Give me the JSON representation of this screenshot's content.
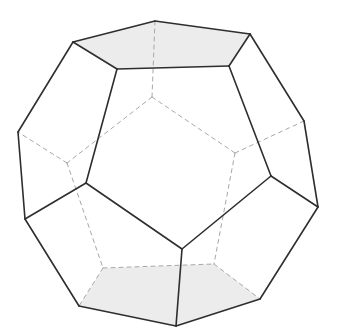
{
  "diagram": {
    "title": "Dodecahedron",
    "colors": {
      "background": "#ffffff",
      "visible_edge": "#2e2e2e",
      "hidden_edge": "#a8a8a8",
      "face_fill": "#ececec"
    },
    "vertices": {
      "T1": [
        73,
        42
      ],
      "T2": [
        155,
        21
      ],
      "T3": [
        250,
        34
      ],
      "T4": [
        229,
        66
      ],
      "T5": [
        117,
        69
      ],
      "L1": [
        18,
        132
      ],
      "R1": [
        304,
        121
      ],
      "FL": [
        86,
        183
      ],
      "FR": [
        271,
        176
      ],
      "L2": [
        25,
        219
      ],
      "R2": [
        318,
        207
      ],
      "FB": [
        182,
        249
      ],
      "B1": [
        79,
        306
      ],
      "B2": [
        176,
        326
      ],
      "B3": [
        260,
        299
      ],
      "H1": [
        152,
        97
      ],
      "H2": [
        67,
        163
      ],
      "H3": [
        235,
        153
      ],
      "H4": [
        103,
        268
      ],
      "H5": [
        214,
        264
      ]
    },
    "shaded_faces": [
      [
        "T1",
        "T2",
        "T3",
        "T4",
        "T5"
      ],
      [
        "B1",
        "H4",
        "H5",
        "B3",
        "B2"
      ]
    ],
    "visible_edges": [
      [
        "T1",
        "T2"
      ],
      [
        "T2",
        "T3"
      ],
      [
        "T3",
        "T4"
      ],
      [
        "T4",
        "T5"
      ],
      [
        "T5",
        "T1"
      ],
      [
        "T1",
        "L1"
      ],
      [
        "T3",
        "R1"
      ],
      [
        "T5",
        "FL"
      ],
      [
        "T4",
        "FR"
      ],
      [
        "L1",
        "L2"
      ],
      [
        "R1",
        "R2"
      ],
      [
        "FL",
        "L2"
      ],
      [
        "FR",
        "R2"
      ],
      [
        "FL",
        "FB"
      ],
      [
        "FR",
        "FB"
      ],
      [
        "L2",
        "B1"
      ],
      [
        "R2",
        "B3"
      ],
      [
        "FB",
        "B2"
      ],
      [
        "B1",
        "B2"
      ],
      [
        "B2",
        "B3"
      ]
    ],
    "hidden_edges": [
      [
        "T2",
        "H1"
      ],
      [
        "H1",
        "H2"
      ],
      [
        "H1",
        "H3"
      ],
      [
        "H2",
        "L1"
      ],
      [
        "H3",
        "R1"
      ],
      [
        "H2",
        "H4"
      ],
      [
        "H3",
        "H5"
      ],
      [
        "H4",
        "H5"
      ],
      [
        "H4",
        "B1"
      ],
      [
        "H5",
        "B3"
      ]
    ]
  }
}
